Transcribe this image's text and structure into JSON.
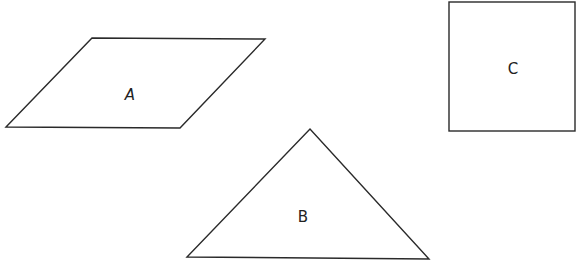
{
  "diagram": {
    "shapes": [
      {
        "id": "A",
        "type": "parallelogram",
        "label": "A"
      },
      {
        "id": "B",
        "type": "triangle",
        "label": "B"
      },
      {
        "id": "C",
        "type": "square",
        "label": "C"
      }
    ]
  }
}
